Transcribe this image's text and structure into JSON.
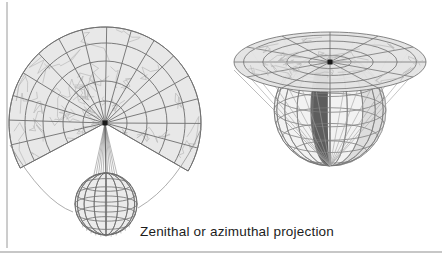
{
  "figure": {
    "caption": "Zenithal or azimuthal projection",
    "background_color": "#ffffff",
    "border": {
      "left_rule_color": "#9a9a9a",
      "bottom_rule_color": "#8f8f8f"
    },
    "panels": [
      {
        "id": "left-panel",
        "name": "azimuthal-map-fan",
        "description": "Fan-shaped azimuthal map projection of the globe with graticule, rays converging to a point, and a small wireframe globe below",
        "map_fill_color": "#e8e8e8",
        "graticule_color": "#6e6e6e",
        "coastline_color": "#b9b9b9",
        "ray_color": "#8a8a8a",
        "convergence_point": {
          "x": 105,
          "y": 123
        },
        "fan": {
          "outer_radius": 96,
          "start_angle_deg": 152,
          "end_angle_deg": 390,
          "meridian_count": 16,
          "parallel_radii": [
            22,
            42,
            62,
            80,
            96
          ]
        },
        "globe": {
          "center": {
            "x": 106,
            "y": 204
          },
          "radius": 31,
          "meridian_count": 8,
          "parallel_count": 5,
          "fill_color": "#ebebeb",
          "line_color": "#6e6e6e"
        }
      },
      {
        "id": "right-panel",
        "name": "azimuthal-projection-solid",
        "description": "Three-dimensional construction: a tangent plane disk above a globe, with projection rays from the pole through the sphere onto the plane; a dark lune marks the projected gore",
        "disk": {
          "center": {
            "x": 330,
            "y": 62
          },
          "radius_x": 96,
          "radius_y": 30,
          "fill_color": "#e4e4e4",
          "line_color": "#6e6e6e"
        },
        "sphere": {
          "center": {
            "x": 330,
            "y": 110
          },
          "radius": 56,
          "fill_color": "#f2f2f2",
          "shaded_fill_color": "#dedede",
          "line_color": "#787878"
        },
        "lune": {
          "color": "#5d5d5d",
          "highlight_color": "#717171"
        },
        "ray_color": "#a0a0a0",
        "tangent_point": {
          "x": 330,
          "y": 62
        }
      }
    ]
  }
}
